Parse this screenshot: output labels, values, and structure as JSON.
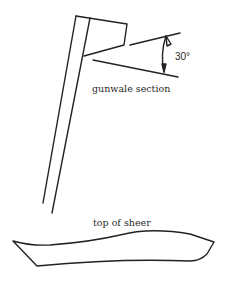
{
  "diagram": {
    "labels": {
      "section": "gunwale section",
      "angle": "30°",
      "sheer": "top of sheer"
    },
    "colors": {
      "line": "#222222",
      "background": "#ffffff"
    }
  }
}
